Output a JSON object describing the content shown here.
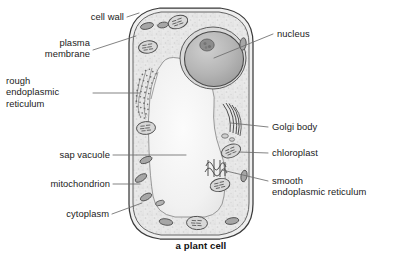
{
  "figure": {
    "caption": "a plant cell"
  },
  "labels_left": [
    {
      "id": "cell-wall",
      "text": "cell wall"
    },
    {
      "id": "plasma-membrane",
      "text": "plasma\nmembrane"
    },
    {
      "id": "rough-er",
      "text": "rough\nendoplasmic\nreticulum"
    },
    {
      "id": "sap-vacuole",
      "text": "sap vacuole"
    },
    {
      "id": "mitochondrion",
      "text": "mitochondrion"
    },
    {
      "id": "cytoplasm",
      "text": "cytoplasm"
    }
  ],
  "labels_right": [
    {
      "id": "nucleus",
      "text": "nucleus"
    },
    {
      "id": "golgi-body",
      "text": "Golgi body"
    },
    {
      "id": "chloroplast",
      "text": "chloroplast"
    },
    {
      "id": "smooth-er",
      "text": "smooth\nendoplasmic reticulum"
    }
  ],
  "colors": {
    "background": "#ffffff",
    "ink": "#1b1b1b",
    "leader_line": "#6d6d6d",
    "cell_wall_stroke": "#3c3c3c",
    "cytoplasm_fill": "#e9e9e9",
    "vacuole_fill": "#f2f2f2",
    "nucleus_fill": "#b9b9b9",
    "nucleolus_fill": "#8e8e8e",
    "organelle_fill": "#d4d4d4",
    "mitochondrion_fill": "#a9a9a9"
  }
}
